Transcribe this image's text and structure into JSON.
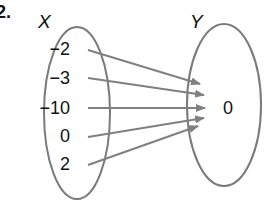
{
  "problem_number": "2.",
  "domain_set": {
    "label": "X",
    "elements": [
      "−2",
      "−3",
      "−10",
      "0",
      "2"
    ]
  },
  "codomain_set": {
    "label": "Y",
    "elements": [
      "0"
    ]
  },
  "mapping": [
    {
      "from": "−2",
      "to": "0"
    },
    {
      "from": "−3",
      "to": "0"
    },
    {
      "from": "−10",
      "to": "0"
    },
    {
      "from": "0",
      "to": "0"
    },
    {
      "from": "2",
      "to": "0"
    }
  ],
  "colors": {
    "ellipse_stroke": "#7a7a7a",
    "arrow": "#808080",
    "text": "#111111"
  }
}
